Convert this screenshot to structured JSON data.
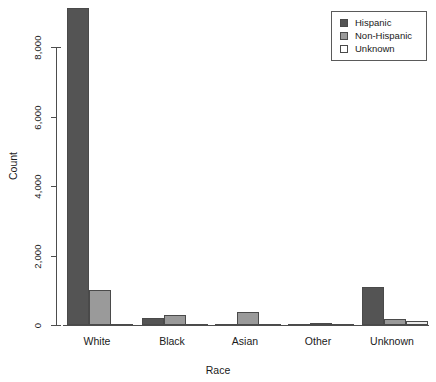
{
  "chart_data": {
    "type": "bar",
    "title": "",
    "subtitle": "",
    "xlabel": "Race",
    "ylabel": "Count",
    "categories": [
      "White",
      "Black",
      "Asian",
      "Other",
      "Unknown"
    ],
    "series": [
      {
        "name": "Hispanic",
        "color": "#545454",
        "values": [
          9120,
          200,
          20,
          15,
          1100
        ]
      },
      {
        "name": "Non-Hispanic",
        "color": "#9a9a9a",
        "values": [
          1020,
          280,
          380,
          55,
          180
        ]
      },
      {
        "name": "Unknown",
        "color": "#ebebeb",
        "values": [
          30,
          15,
          15,
          10,
          110
        ]
      }
    ],
    "ylim": [
      0,
      9400
    ],
    "yticks": [
      0,
      2000,
      4000,
      6000,
      8000
    ],
    "ytick_labels": [
      "0",
      "2,000",
      "4,000",
      "6,000",
      "8,000"
    ],
    "grid": false,
    "legend_position": "top-right",
    "legend_entries": [
      "Hispanic",
      "Non-Hispanic",
      "Unknown"
    ],
    "bar_border_color": "#4a4a4a",
    "axis_color": "#4d4d4d",
    "background": "#ffffff"
  },
  "axes": {
    "y_title": "Count",
    "x_title": "Race",
    "y_tick_0": "0",
    "y_tick_1": "2,000",
    "y_tick_2": "4,000",
    "y_tick_3": "6,000",
    "y_tick_4": "8,000",
    "x_cat_0": "White",
    "x_cat_1": "Black",
    "x_cat_2": "Asian",
    "x_cat_3": "Other",
    "x_cat_4": "Unknown"
  },
  "legend": {
    "item_0": "Hispanic",
    "item_1": "Non-Hispanic",
    "item_2": "Unknown"
  }
}
